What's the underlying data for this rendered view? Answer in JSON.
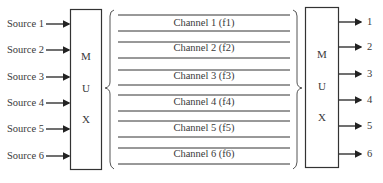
{
  "sources": [
    {
      "label": "Source 1",
      "y": 24
    },
    {
      "label": "Source 2",
      "y": 50
    },
    {
      "label": "Source 3",
      "y": 77
    },
    {
      "label": "Source 4",
      "y": 103
    },
    {
      "label": "Source 5",
      "y": 129
    },
    {
      "label": "Source 6",
      "y": 156
    }
  ],
  "mux_left": {
    "letters": [
      "M",
      "U",
      "X"
    ]
  },
  "mux_right": {
    "letters": [
      "M",
      "U",
      "X"
    ]
  },
  "channels": [
    {
      "label": "Channel 1 (f1)"
    },
    {
      "label": "Channel 2 (f2)"
    },
    {
      "label": "Channel 3 (f3)"
    },
    {
      "label": "Channel 4 (f4)"
    },
    {
      "label": "Channel 5 (f5)"
    },
    {
      "label": "Channel 6 (f6)"
    }
  ],
  "outputs": [
    {
      "label": "1",
      "y": 22
    },
    {
      "label": "2",
      "y": 47
    },
    {
      "label": "3",
      "y": 74
    },
    {
      "label": "4",
      "y": 100
    },
    {
      "label": "5",
      "y": 126
    },
    {
      "label": "6",
      "y": 154
    }
  ]
}
